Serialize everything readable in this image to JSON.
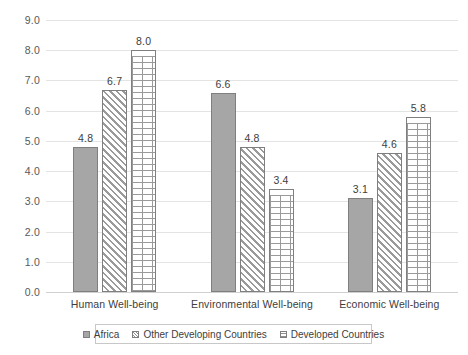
{
  "chart_data": {
    "type": "bar",
    "title": "",
    "xlabel": "",
    "ylabel": "",
    "ylim": [
      0.0,
      9.0
    ],
    "grid": true,
    "legend_position": "bottom",
    "categories": [
      "Human Well-being",
      "Environmental Well-being",
      "Economic Well-being"
    ],
    "series": [
      {
        "name": "Africa",
        "pattern": "solid",
        "values": [
          4.8,
          6.6,
          3.1
        ]
      },
      {
        "name": "Other Developing Countries",
        "pattern": "diagonal-stripes",
        "values": [
          6.7,
          4.8,
          4.6
        ]
      },
      {
        "name": "Developed Countries",
        "pattern": "brick",
        "values": [
          8.0,
          3.4,
          5.8
        ]
      }
    ],
    "yticks": [
      "0.0",
      "1.0",
      "2.0",
      "3.0",
      "4.0",
      "5.0",
      "6.0",
      "7.0",
      "8.0",
      "9.0"
    ],
    "data_labels": {
      "group_0": [
        "4.8",
        "6.7",
        "8.0"
      ],
      "group_1": [
        "6.6",
        "4.8",
        "3.4"
      ],
      "group_2": [
        "3.1",
        "4.6",
        "5.8"
      ]
    },
    "colors": {
      "bar_fill_solid": "#a6a6a6",
      "bar_outline": "#7f7f7f",
      "gridline": "#e4e4e4",
      "text": "#404040",
      "background": "#ffffff"
    }
  },
  "legend": {
    "items": [
      {
        "label": "Africa"
      },
      {
        "label": "Other Developing Countries"
      },
      {
        "label": "Developed Countries"
      }
    ]
  }
}
